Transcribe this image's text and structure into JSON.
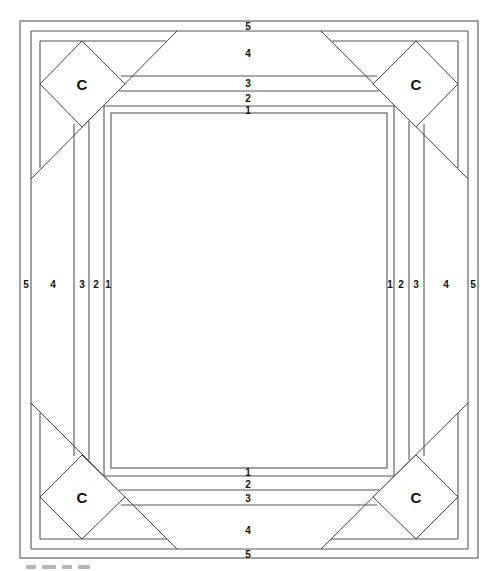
{
  "diagram": {
    "top_labels": [
      "5",
      "4",
      "3",
      "2",
      "1"
    ],
    "bottom_labels": [
      "1",
      "2",
      "3",
      "4",
      "5"
    ],
    "left_labels": [
      "5",
      "4",
      "3",
      "2",
      "1"
    ],
    "right_labels": [
      "1",
      "2",
      "3",
      "4",
      "5"
    ],
    "corner_label": "C",
    "corners": {
      "top_left": "C",
      "top_right": "C",
      "bottom_left": "C",
      "bottom_right": "C"
    },
    "line_color": "#555555",
    "background": "#ffffff"
  },
  "caption": {
    "visible": "partially cut off, illegible"
  }
}
